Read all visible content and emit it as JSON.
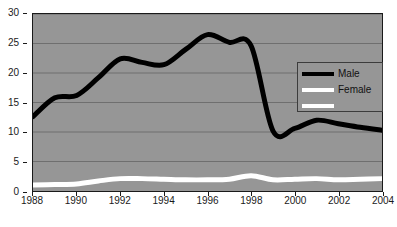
{
  "chart_data": {
    "type": "line",
    "title": "",
    "subtitle": "",
    "xlabel": "",
    "ylabel": "",
    "xlim": [
      1988,
      2004
    ],
    "ylim": [
      0,
      30
    ],
    "grid": true,
    "grid_axis": "y",
    "legend_position": "inside-right",
    "plot_background": "#969696",
    "x": [
      1988,
      1989,
      1990,
      1991,
      1992,
      1993,
      1994,
      1995,
      1996,
      1997,
      1998,
      1999,
      2000,
      2001,
      2002,
      2003,
      2004
    ],
    "x_tick_labels": [
      "1988",
      "1990",
      "1992",
      "1994",
      "1996",
      "1998",
      "2000",
      "2002",
      "2004"
    ],
    "x_tick_values": [
      1988,
      1990,
      1992,
      1994,
      1996,
      1998,
      2000,
      2002,
      2004
    ],
    "y_tick_labels": [
      "0",
      "5",
      "10",
      "15",
      "20",
      "25",
      "30"
    ],
    "y_tick_values": [
      0,
      5,
      10,
      15,
      20,
      25,
      30
    ],
    "series": [
      {
        "name": "Male",
        "color": "#000000",
        "line_width": 5,
        "values": [
          12.6,
          15.8,
          16.2,
          19.2,
          22.4,
          21.8,
          21.4,
          24.0,
          26.5,
          25.2,
          24.6,
          10.2,
          10.6,
          12.0,
          11.4,
          10.8,
          10.3
        ]
      },
      {
        "name": "Female",
        "color": "#ffffff",
        "line_width": 5,
        "values": [
          1.0,
          1.1,
          1.2,
          1.7,
          2.1,
          2.1,
          2.0,
          1.9,
          1.9,
          2.0,
          2.6,
          1.9,
          2.0,
          2.1,
          1.9,
          2.0,
          2.1
        ]
      }
    ],
    "legend_entries": [
      {
        "label": "Male",
        "color": "#000000"
      },
      {
        "label": "Female",
        "color": "#ffffff"
      },
      {
        "label": "",
        "color": "#ffffff"
      }
    ]
  }
}
